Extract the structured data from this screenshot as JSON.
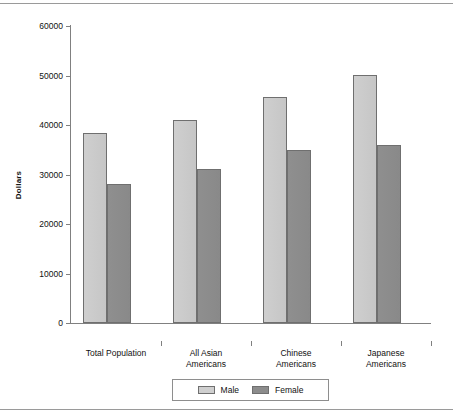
{
  "chart_data": {
    "type": "bar",
    "title": "",
    "xlabel": "",
    "ylabel": "Dollars",
    "ylim": [
      0,
      60000
    ],
    "yticks": [
      0,
      10000,
      20000,
      30000,
      40000,
      50000,
      60000
    ],
    "ytick_labels": [
      "0",
      "10000",
      "20000",
      "30000",
      "40000",
      "50000",
      "60000"
    ],
    "grid": false,
    "legend_position": "bottom",
    "categories": [
      "Total Population",
      "All Asian\nAmericans",
      "Chinese\nAmericans",
      "Japanese\nAmericans"
    ],
    "series": [
      {
        "name": "Male",
        "color": "#cfcfcf",
        "values": [
          38300,
          41000,
          45600,
          50100
        ]
      },
      {
        "name": "Female",
        "color": "#8c8c8c",
        "values": [
          28100,
          31200,
          35000,
          35900
        ]
      }
    ]
  },
  "legend": {
    "male_label": "Male",
    "female_label": "Female"
  }
}
